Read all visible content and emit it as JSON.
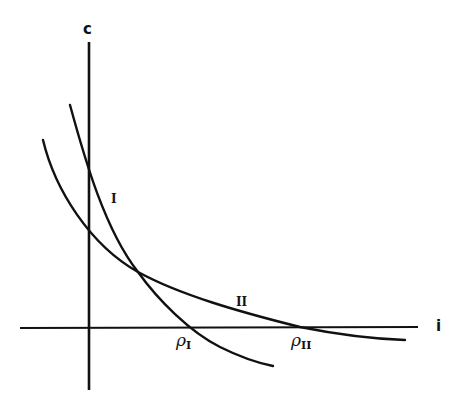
{
  "diagram": {
    "axes": {
      "y_label": "c",
      "x_label": "i"
    },
    "curves": [
      {
        "id": "I",
        "label": "I",
        "description": "steeper downward-sloping curve"
      },
      {
        "id": "II",
        "label": "II",
        "description": "flatter downward-sloping curve"
      }
    ],
    "intercepts": [
      {
        "symbol": "ρ",
        "subscript": "I"
      },
      {
        "symbol": "ρ",
        "subscript": "II"
      }
    ],
    "colors": {
      "ink": "#111111",
      "background": "#ffffff"
    }
  }
}
